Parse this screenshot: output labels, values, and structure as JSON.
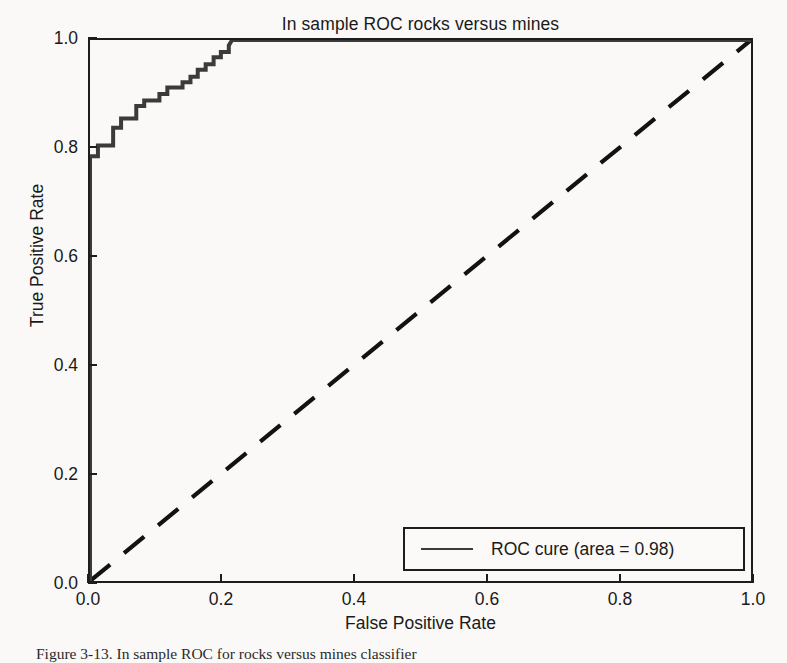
{
  "figure": {
    "caption": "Figure 3-13. In sample ROC for rocks versus mines classifier"
  },
  "legend": {
    "entry_label": "ROC cure (area = 0.98)",
    "position": "lower-right",
    "line_color": "#3b3b3b"
  },
  "colors": {
    "curve": "#3b3b3b",
    "diagonal": "#121212",
    "frame": "#1d1d1d",
    "text": "#1a1a1a",
    "background": "#faf9f7"
  },
  "chart_data": {
    "type": "line",
    "title": "In sample ROC rocks versus mines",
    "xlabel": "False Positive Rate",
    "ylabel": "True Positive Rate",
    "xlim": [
      0.0,
      1.0
    ],
    "ylim": [
      0.0,
      1.0
    ],
    "xticks": [
      0.0,
      0.2,
      0.4,
      0.6,
      0.8,
      1.0
    ],
    "yticks": [
      0.0,
      0.2,
      0.4,
      0.6,
      0.8,
      1.0
    ],
    "xticklabels": [
      "0.0",
      "0.2",
      "0.4",
      "0.6",
      "0.8",
      "1.0"
    ],
    "yticklabels": [
      "0.0",
      "0.2",
      "0.4",
      "0.6",
      "0.8",
      "1.0"
    ],
    "grid": false,
    "legend_position": "lower right",
    "annotations": [
      "area = 0.98"
    ],
    "series": [
      {
        "name": "ROC cure (area = 0.98)",
        "style": "step-post",
        "linestyle": "solid",
        "color": "#3b3b3b",
        "x": [
          0.0,
          0.0,
          0.012,
          0.012,
          0.035,
          0.035,
          0.047,
          0.047,
          0.07,
          0.07,
          0.082,
          0.082,
          0.105,
          0.105,
          0.117,
          0.117,
          0.14,
          0.14,
          0.152,
          0.152,
          0.163,
          0.163,
          0.175,
          0.175,
          0.187,
          0.187,
          0.198,
          0.198,
          0.21,
          0.21,
          0.215,
          1.0
        ],
        "y": [
          0.0,
          0.785,
          0.785,
          0.805,
          0.805,
          0.838,
          0.838,
          0.855,
          0.855,
          0.878,
          0.878,
          0.888,
          0.888,
          0.9,
          0.9,
          0.912,
          0.912,
          0.922,
          0.922,
          0.932,
          0.932,
          0.945,
          0.945,
          0.955,
          0.955,
          0.968,
          0.968,
          0.978,
          0.978,
          0.99,
          1.0,
          1.0
        ]
      },
      {
        "name": "chance-diagonal",
        "style": "line",
        "linestyle": "dashed",
        "color": "#121212",
        "x": [
          0.0,
          1.0
        ],
        "y": [
          0.0,
          1.0
        ]
      }
    ]
  }
}
